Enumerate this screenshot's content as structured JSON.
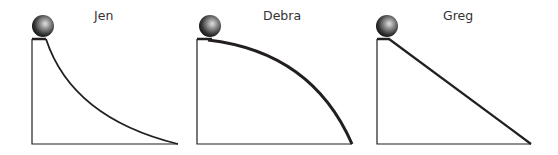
{
  "panels": [
    {
      "name": "Jen",
      "ramp": "concave"
    },
    {
      "name": "Debra",
      "ramp": "convex"
    },
    {
      "name": "Greg",
      "ramp": "straight"
    }
  ],
  "colors": {
    "line": "#231f20",
    "ball_dark": "#1a1a1a",
    "ball_light": "#9a9a9a"
  }
}
